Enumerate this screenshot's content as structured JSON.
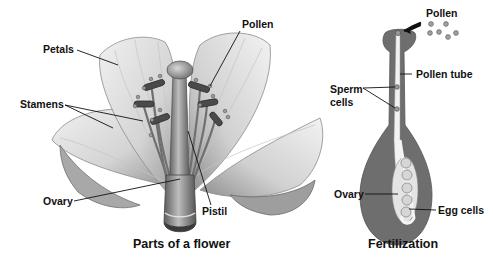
{
  "diagram": {
    "flower": {
      "caption": "Parts of a flower",
      "labels": {
        "petals": "Petals",
        "pollen": "Pollen",
        "stamens": "Stamens",
        "ovary": "Ovary",
        "pistil": "Pistil"
      }
    },
    "fertilization": {
      "caption": "Fertilization",
      "labels": {
        "pollen": "Pollen",
        "pollen_tube": "Pollen tube",
        "sperm_cells_line1": "Sperm",
        "sperm_cells_line2": "cells",
        "ovary": "Ovary",
        "egg_cells": "Egg cells"
      }
    },
    "colors": {
      "background": "#ffffff",
      "petal_light": "#e6e6e6",
      "petal_mid": "#bdbdbd",
      "petal_dark": "#7a7a7a",
      "tissue_dark": "#6e6e6e",
      "tube_light": "#f2f2f2",
      "label_text": "#111111"
    }
  }
}
